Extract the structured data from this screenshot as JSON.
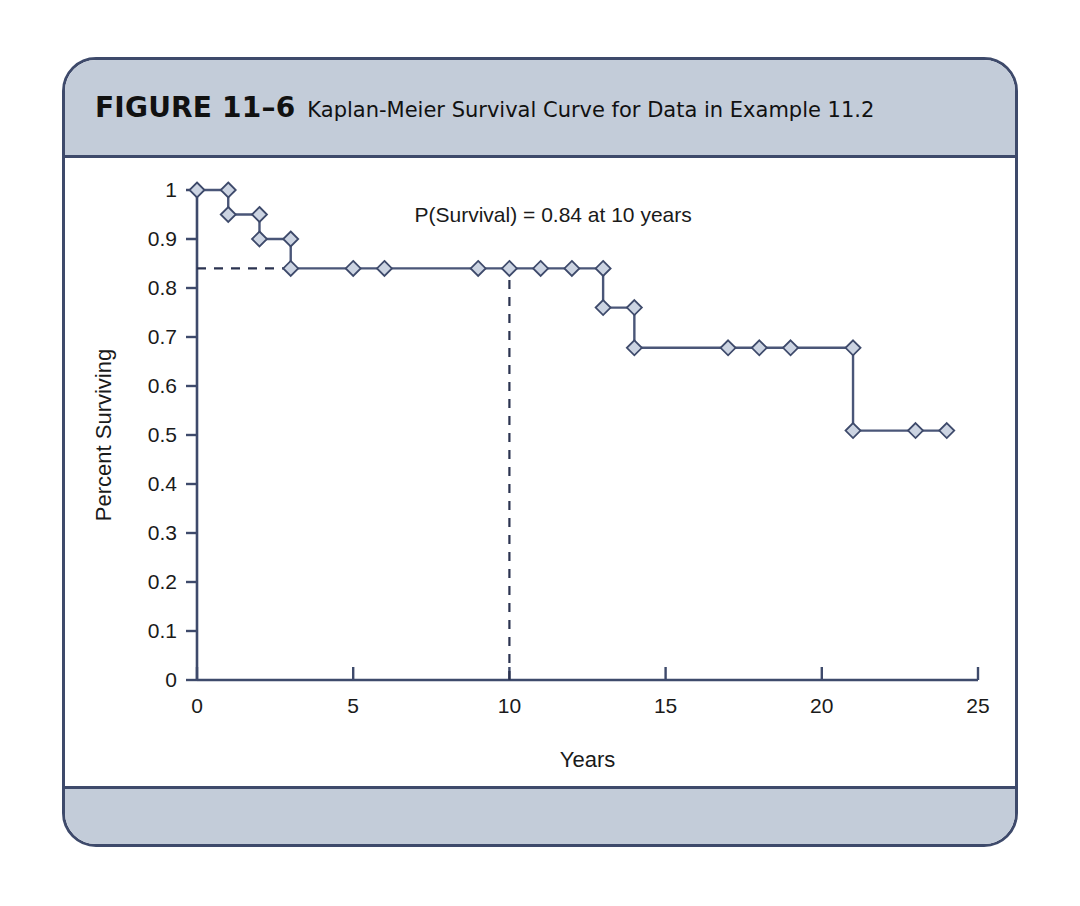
{
  "figure": {
    "label": "FIGURE 11–6",
    "caption": "Kaplan-Meier Survival Curve for Data in Example 11.2"
  },
  "colors": {
    "band": "#c3ccd9",
    "border": "#3e4a6b",
    "curve": "#4a5678",
    "marker_fill": "#ccd4e2",
    "reference": "#2b3350",
    "page_background": "#ffffff"
  },
  "chart_data": {
    "type": "line",
    "subtype": "kaplan-meier-step",
    "title": "Kaplan-Meier Survival Curve for Data in Example 11.2",
    "xlabel": "Years",
    "ylabel": "Percent Surviving",
    "xlim": [
      0,
      25
    ],
    "ylim": [
      0,
      1
    ],
    "grid": false,
    "legend": null,
    "xticks": [
      0,
      5,
      10,
      15,
      20,
      25
    ],
    "xticklabels": [
      "0",
      "5",
      "10",
      "15",
      "20",
      "25"
    ],
    "yticks": [
      0,
      0.1,
      0.2,
      0.3,
      0.4,
      0.5,
      0.6,
      0.7,
      0.8,
      0.9,
      1
    ],
    "yticklabels": [
      "0",
      "0.1",
      "0.2",
      "0.3",
      "0.4",
      "0.5",
      "0.6",
      "0.7",
      "0.8",
      "0.9",
      "1"
    ],
    "series": [
      {
        "name": "Survival probability",
        "step": "post",
        "x": [
          0,
          1,
          2,
          3,
          5,
          6,
          9,
          10,
          11,
          12,
          13,
          14,
          17,
          18,
          19,
          21,
          23,
          24
        ],
        "y": [
          1.0,
          1.0,
          0.95,
          0.9,
          0.84,
          0.84,
          0.84,
          0.84,
          0.84,
          0.84,
          0.84,
          0.76,
          0.678,
          0.678,
          0.678,
          0.678,
          0.509,
          0.509
        ],
        "markers": [
          {
            "x": 0,
            "y": 1.0
          },
          {
            "x": 1,
            "y": 1.0
          },
          {
            "x": 1,
            "y": 0.95
          },
          {
            "x": 2,
            "y": 0.95
          },
          {
            "x": 2,
            "y": 0.9
          },
          {
            "x": 3,
            "y": 0.9
          },
          {
            "x": 3,
            "y": 0.84
          },
          {
            "x": 5,
            "y": 0.84
          },
          {
            "x": 6,
            "y": 0.84
          },
          {
            "x": 9,
            "y": 0.84
          },
          {
            "x": 10,
            "y": 0.84
          },
          {
            "x": 11,
            "y": 0.84
          },
          {
            "x": 12,
            "y": 0.84
          },
          {
            "x": 13,
            "y": 0.84
          },
          {
            "x": 13,
            "y": 0.76
          },
          {
            "x": 14,
            "y": 0.76
          },
          {
            "x": 14,
            "y": 0.678
          },
          {
            "x": 17,
            "y": 0.678
          },
          {
            "x": 18,
            "y": 0.678
          },
          {
            "x": 19,
            "y": 0.678
          },
          {
            "x": 21,
            "y": 0.678
          },
          {
            "x": 21,
            "y": 0.509
          },
          {
            "x": 23,
            "y": 0.509
          },
          {
            "x": 24,
            "y": 0.509
          }
        ],
        "step_points": [
          {
            "x": 0,
            "y": 1.0
          },
          {
            "x": 1,
            "y": 1.0
          },
          {
            "x": 1,
            "y": 0.95
          },
          {
            "x": 2,
            "y": 0.95
          },
          {
            "x": 2,
            "y": 0.9
          },
          {
            "x": 3,
            "y": 0.9
          },
          {
            "x": 3,
            "y": 0.84
          },
          {
            "x": 13,
            "y": 0.84
          },
          {
            "x": 13,
            "y": 0.76
          },
          {
            "x": 14,
            "y": 0.76
          },
          {
            "x": 14,
            "y": 0.678
          },
          {
            "x": 21,
            "y": 0.678
          },
          {
            "x": 21,
            "y": 0.509
          },
          {
            "x": 24,
            "y": 0.509
          }
        ]
      }
    ],
    "annotations": [
      {
        "text": "P(Survival) = 0.84 at 10 years",
        "x": 11.4,
        "y": 0.935,
        "anchor": "middle"
      }
    ],
    "reference_lines": [
      {
        "name": "horizontal-0.84",
        "orientation": "horizontal",
        "value": 0.84,
        "from_x": 0,
        "to_x": 3,
        "style": "dashed"
      },
      {
        "name": "vertical-10-years",
        "orientation": "vertical",
        "value": 10,
        "from_y": 0,
        "to_y": 0.84,
        "style": "dashed"
      }
    ]
  }
}
